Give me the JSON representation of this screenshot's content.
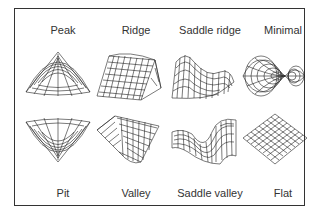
{
  "diagram": {
    "top_row": [
      {
        "label": "Peak",
        "shape": "peak"
      },
      {
        "label": "Ridge",
        "shape": "ridge"
      },
      {
        "label": "Saddle ridge",
        "shape": "saddle-ridge"
      },
      {
        "label": "Minimal",
        "shape": "minimal"
      }
    ],
    "bottom_row": [
      {
        "label": "Pit",
        "shape": "pit"
      },
      {
        "label": "Valley",
        "shape": "valley"
      },
      {
        "label": "Saddle valley",
        "shape": "saddle-valley"
      },
      {
        "label": "Flat",
        "shape": "flat"
      }
    ]
  }
}
